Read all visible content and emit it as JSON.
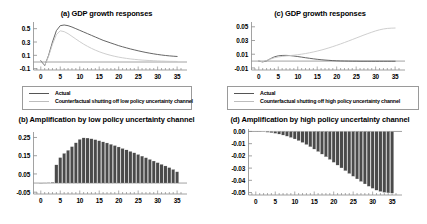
{
  "figure": {
    "background": "#ffffff",
    "series_colors": {
      "actual": "#555555",
      "counterfactual": "#c8c8c8",
      "bars": "#4a4a4a"
    },
    "axis_color": "#8a8a8a"
  },
  "chart_data": [
    {
      "id": "panel-a",
      "type": "line",
      "title": "(a) GDP growth responses",
      "xlabel": "",
      "ylabel": "",
      "xlim": [
        -2,
        36
      ],
      "ylim": [
        -0.12,
        0.6
      ],
      "xticks": [
        0,
        5,
        10,
        15,
        20,
        25,
        30,
        35
      ],
      "xtick_labels": [
        "0",
        "5",
        "10",
        "15",
        "20",
        "25",
        "30",
        "35"
      ],
      "yticks": [
        -0.1,
        0.1,
        0.3,
        0.5
      ],
      "ytick_labels": [
        "-0.1",
        "0.1",
        "0.3",
        "0.5"
      ],
      "grid": false,
      "legend_position": "below",
      "zero_line": true,
      "x": [
        0,
        1,
        2,
        3,
        4,
        5,
        6,
        7,
        8,
        9,
        10,
        11,
        12,
        13,
        14,
        15,
        16,
        17,
        18,
        19,
        20,
        21,
        22,
        23,
        24,
        25,
        26,
        27,
        28,
        29,
        30,
        31,
        32,
        33,
        34,
        35
      ],
      "series": [
        {
          "name": "Actual",
          "color": "#555555",
          "values": [
            0.02,
            -0.055,
            0.1,
            0.3,
            0.47,
            0.545,
            0.555,
            0.545,
            0.525,
            0.5,
            0.475,
            0.45,
            0.425,
            0.4,
            0.375,
            0.35,
            0.325,
            0.305,
            0.285,
            0.265,
            0.245,
            0.228,
            0.212,
            0.196,
            0.182,
            0.168,
            0.155,
            0.143,
            0.132,
            0.122,
            0.113,
            0.105,
            0.098,
            0.092,
            0.087,
            0.083
          ]
        },
        {
          "name": "Counterfactual shutting off low policy uncertainty channel",
          "color": "#c8c8c8",
          "values": [
            0.01,
            -0.05,
            0.085,
            0.265,
            0.41,
            0.468,
            0.455,
            0.425,
            0.385,
            0.345,
            0.305,
            0.268,
            0.235,
            0.205,
            0.178,
            0.154,
            0.133,
            0.115,
            0.099,
            0.085,
            0.073,
            0.063,
            0.054,
            0.046,
            0.04,
            0.034,
            0.029,
            0.025,
            0.022,
            0.019,
            0.016,
            0.014,
            0.012,
            0.01,
            0.009,
            0.008
          ]
        }
      ]
    },
    {
      "id": "panel-c",
      "type": "line",
      "title": "(c)  GDP growth responses",
      "xlabel": "",
      "ylabel": "",
      "xlim": [
        -2,
        36
      ],
      "ylim": [
        -0.013,
        0.057
      ],
      "xticks": [
        0,
        5,
        10,
        15,
        20,
        25,
        30,
        35
      ],
      "xtick_labels": [
        "0",
        "5",
        "10",
        "15",
        "20",
        "25",
        "30",
        "35"
      ],
      "yticks": [
        -0.01,
        0.01,
        0.03,
        0.05
      ],
      "ytick_labels": [
        "-0.01",
        "0.01",
        "0.03",
        "0.05"
      ],
      "grid": false,
      "legend_position": "below",
      "zero_line": true,
      "x": [
        0,
        1,
        2,
        3,
        4,
        5,
        6,
        7,
        8,
        9,
        10,
        11,
        12,
        13,
        14,
        15,
        16,
        17,
        18,
        19,
        20,
        21,
        22,
        23,
        24,
        25,
        26,
        27,
        28,
        29,
        30,
        31,
        32,
        33,
        34,
        35
      ],
      "series": [
        {
          "name": "Actual",
          "color": "#555555",
          "values": [
            0.0,
            -0.0012,
            0.0004,
            0.0035,
            0.0062,
            0.0076,
            0.0082,
            0.0083,
            0.008,
            0.0074,
            0.0066,
            0.0058,
            0.0049,
            0.0041,
            0.0033,
            0.0026,
            0.002,
            0.0015,
            0.0011,
            0.0007,
            0.0004,
            0.0002,
            0.0001,
            0.0,
            -0.0001,
            -0.0001,
            -0.0002,
            -0.0002,
            -0.0002,
            -0.0002,
            -0.0002,
            -0.0002,
            -0.0002,
            -0.0002,
            -0.0002,
            -0.0002
          ]
        },
        {
          "name": "Counterfactual shutting off high policy uncertainty channel",
          "color": "#c8c8c8",
          "values": [
            0.0,
            -0.0008,
            0.0008,
            0.003,
            0.0048,
            0.006,
            0.0068,
            0.0074,
            0.008,
            0.0086,
            0.0093,
            0.0101,
            0.011,
            0.0121,
            0.0133,
            0.0146,
            0.016,
            0.0176,
            0.0193,
            0.0211,
            0.023,
            0.025,
            0.0271,
            0.0292,
            0.0314,
            0.0336,
            0.0358,
            0.038,
            0.0401,
            0.0421,
            0.044,
            0.0456,
            0.0468,
            0.0476,
            0.048,
            0.0482
          ]
        }
      ]
    },
    {
      "id": "panel-b",
      "type": "bar",
      "title": "(b) Amplification by low policy uncertainty channel",
      "xlabel": "",
      "ylabel": "",
      "xlim": [
        -2,
        36
      ],
      "ylim": [
        -0.06,
        0.28
      ],
      "xticks": [
        0,
        5,
        10,
        15,
        20,
        25,
        30,
        35
      ],
      "xtick_labels": [
        "0",
        "5",
        "10",
        "15",
        "20",
        "25",
        "30",
        "35"
      ],
      "yticks": [
        -0.05,
        0.05,
        0.15,
        0.25
      ],
      "ytick_labels": [
        "-0.05",
        "0.05",
        "0.15",
        "0.25"
      ],
      "grid": false,
      "bar_color": "#4a4a4a",
      "zero_line": true,
      "categories": [
        0,
        1,
        2,
        3,
        4,
        5,
        6,
        7,
        8,
        9,
        10,
        11,
        12,
        13,
        14,
        15,
        16,
        17,
        18,
        19,
        20,
        21,
        22,
        23,
        24,
        25,
        26,
        27,
        28,
        29,
        30,
        31,
        32,
        33,
        34,
        35
      ],
      "values": [
        0.0,
        0.001,
        0.002,
        0.004,
        0.1,
        0.14,
        0.163,
        0.18,
        0.2,
        0.221,
        0.24,
        0.248,
        0.247,
        0.243,
        0.238,
        0.232,
        0.226,
        0.22,
        0.213,
        0.206,
        0.198,
        0.19,
        0.182,
        0.174,
        0.166,
        0.157,
        0.148,
        0.139,
        0.13,
        0.121,
        0.112,
        0.103,
        0.094,
        0.085,
        0.075,
        0.062
      ]
    },
    {
      "id": "panel-d",
      "type": "bar",
      "title": "(d) Amplification by high policy uncertainty channel",
      "xlabel": "",
      "ylabel": "",
      "xlim": [
        -2,
        36
      ],
      "ylim": [
        -0.052,
        0.002
      ],
      "xticks": [
        0,
        5,
        10,
        15,
        20,
        25,
        30,
        35
      ],
      "xtick_labels": [
        "0",
        "5",
        "10",
        "15",
        "20",
        "25",
        "30",
        "35"
      ],
      "yticks": [
        0.0,
        -0.01,
        -0.02,
        -0.03,
        -0.04,
        -0.05
      ],
      "ytick_labels": [
        "0.00",
        "-0.01",
        "-0.02",
        "-0.03",
        "-0.04",
        "-0.05"
      ],
      "grid": false,
      "bar_color": "#4a4a4a",
      "zero_line": true,
      "categories": [
        0,
        1,
        2,
        3,
        4,
        5,
        6,
        7,
        8,
        9,
        10,
        11,
        12,
        13,
        14,
        15,
        16,
        17,
        18,
        19,
        20,
        21,
        22,
        23,
        24,
        25,
        26,
        27,
        28,
        29,
        30,
        31,
        32,
        33,
        34,
        35
      ],
      "values": [
        0.0,
        -0.0002,
        -0.0004,
        -0.0007,
        -0.0011,
        -0.0016,
        -0.0022,
        -0.003,
        -0.0039,
        -0.005,
        -0.0062,
        -0.0076,
        -0.0091,
        -0.0108,
        -0.0126,
        -0.0145,
        -0.0165,
        -0.0186,
        -0.0208,
        -0.023,
        -0.0253,
        -0.0276,
        -0.0299,
        -0.0322,
        -0.0345,
        -0.0367,
        -0.0389,
        -0.041,
        -0.043,
        -0.0449,
        -0.0466,
        -0.0481,
        -0.0492,
        -0.0499,
        -0.0503,
        -0.0505
      ]
    }
  ]
}
